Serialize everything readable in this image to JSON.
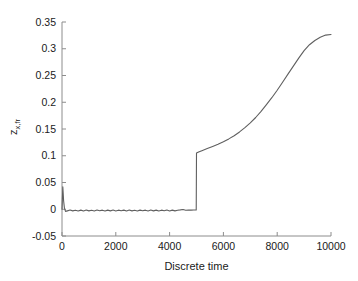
{
  "chart_data": {
    "type": "line",
    "title": "",
    "subtitle": "",
    "xlabel": "Discrete time",
    "ylabel": "z_x,fr",
    "ylabel_base": "z",
    "ylabel_sub": "x,fr",
    "xlim": [
      0,
      10000
    ],
    "ylim": [
      -0.05,
      0.35
    ],
    "grid": false,
    "legend": null,
    "legend_position": "none",
    "line_color": "#5f5f5f",
    "axis_color": "#8c8c8c",
    "text_color": "#1a1a1a",
    "xticks": [
      0,
      2000,
      4000,
      6000,
      8000,
      10000
    ],
    "xtick_labels": [
      "0",
      "2000",
      "4000",
      "6000",
      "8000",
      "10000"
    ],
    "yticks": [
      -0.05,
      0,
      0.05,
      0.1,
      0.15,
      0.2,
      0.25,
      0.3,
      0.35
    ],
    "ytick_labels": [
      "-0.05",
      "0",
      "0.05",
      "0.1",
      "0.15",
      "0.2",
      "0.25",
      "0.3",
      "0.35"
    ],
    "series": [
      {
        "name": "z_x,fr",
        "x": [
          0,
          30,
          60,
          90,
          130,
          200,
          300,
          400,
          500,
          600,
          700,
          800,
          900,
          1000,
          1100,
          1200,
          1300,
          1400,
          1500,
          1600,
          1700,
          1800,
          1900,
          2000,
          2100,
          2200,
          2300,
          2400,
          2500,
          2600,
          2700,
          2800,
          2900,
          3000,
          3100,
          3200,
          3300,
          3400,
          3500,
          3600,
          3700,
          3800,
          3900,
          4000,
          4100,
          4200,
          4300,
          4400,
          4500,
          4600,
          4700,
          4800,
          4900,
          4990,
          5000,
          5100,
          5200,
          5400,
          5600,
          5800,
          6000,
          6200,
          6400,
          6600,
          6800,
          7000,
          7200,
          7400,
          7600,
          7800,
          8000,
          8200,
          8400,
          8600,
          8800,
          9000,
          9200,
          9400,
          9600,
          9800,
          10000
        ],
        "y": [
          0.0,
          0.042,
          0.016,
          0.002,
          -0.004,
          -0.003,
          -0.0015,
          -0.003,
          -0.0018,
          -0.0032,
          -0.0016,
          -0.0033,
          -0.0015,
          -0.003,
          -0.0018,
          -0.0031,
          -0.0014,
          -0.0029,
          -0.0017,
          -0.0032,
          -0.0016,
          -0.003,
          -0.0015,
          -0.0031,
          -0.0017,
          -0.0029,
          -0.0016,
          -0.0032,
          -0.0015,
          -0.003,
          -0.0018,
          -0.0031,
          -0.0016,
          -0.0029,
          -0.0017,
          -0.0032,
          -0.0015,
          -0.003,
          -0.0016,
          -0.0031,
          -0.0017,
          -0.0029,
          -0.0015,
          -0.0032,
          -0.0016,
          -0.003,
          -0.0018,
          -0.0012,
          -0.0004,
          -0.0018,
          -0.0015,
          -0.0016,
          -0.0015,
          -0.0015,
          0.105,
          0.1075,
          0.1095,
          0.1135,
          0.1175,
          0.1215,
          0.126,
          0.1315,
          0.1375,
          0.1445,
          0.1525,
          0.1615,
          0.1715,
          0.183,
          0.1955,
          0.2085,
          0.2225,
          0.2375,
          0.2525,
          0.2675,
          0.2825,
          0.2965,
          0.3075,
          0.3155,
          0.3215,
          0.3255,
          0.3265
        ],
        "step_time": 5000,
        "step_from": 0.0,
        "step_to": 0.105,
        "initial_spike": 0.042,
        "final_value": 0.3265
      }
    ]
  },
  "plot_geometry": {
    "left": 62,
    "right": 331,
    "top": 22,
    "bottom": 236
  }
}
